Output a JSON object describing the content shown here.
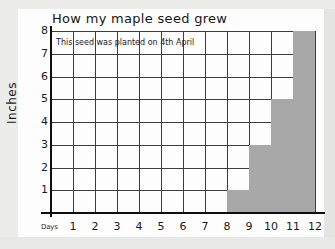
{
  "chart_data": {
    "type": "bar",
    "title": "How my maple seed grew",
    "annotation": "This seed was planted on 4th April",
    "xlabel": "Days",
    "ylabel": "Inches",
    "categories": [
      1,
      2,
      3,
      4,
      5,
      6,
      7,
      8,
      9,
      10,
      11,
      12
    ],
    "x_tick_labels": [
      "1",
      "2",
      "3",
      "4",
      "5",
      "6",
      "7",
      "8",
      "9",
      "10",
      "11",
      "12"
    ],
    "y_tick_labels": [
      "1",
      "2",
      "3",
      "4",
      "5",
      "6",
      "7",
      "8"
    ],
    "y_ticks": [
      1,
      2,
      3,
      4,
      5,
      6,
      7,
      8
    ],
    "values": [
      0,
      0,
      0,
      0,
      0,
      0,
      0,
      1,
      3,
      5,
      8,
      0
    ],
    "bars": [
      {
        "day_start": 8,
        "day_end": 9,
        "height": 1
      },
      {
        "day_start": 9,
        "day_end": 10,
        "height": 3
      },
      {
        "day_start": 10,
        "day_end": 11,
        "height": 5
      },
      {
        "day_start": 11,
        "day_end": 12,
        "height": 8
      }
    ],
    "xlim": [
      0,
      12
    ],
    "ylim": [
      0,
      8
    ],
    "grid": true,
    "legend": false,
    "bar_color": "#a8a8a8",
    "grid_color": "#3d3d3d",
    "axis_color": "#0e0e0e",
    "paper_color": "#fdfdfd",
    "background_color": "#ececeb"
  }
}
